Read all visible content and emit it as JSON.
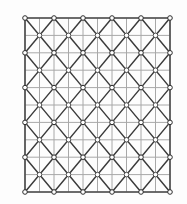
{
  "figure": {
    "type": "lattice-diagram",
    "background_color": "#fdfdfd",
    "width": 187,
    "height": 204
  },
  "lattice": {
    "description": "5 by 5 array of square cells; each cell carries both diagonals, a centre node, and nodes at every cell corner and edge midpoint",
    "cells_x": 5,
    "cells_y": 5,
    "origin_x": 25,
    "origin_y": 18,
    "cell_width": 29,
    "cell_height": 34.8,
    "corner_nodes_x": 6,
    "corner_nodes_y": 6,
    "centre_nodes": 25,
    "node_radius": 2.3,
    "colors": {
      "diagonal_edge": "#3b3b3b",
      "grid_edge": "#a8a8a8",
      "boundary_edge": "#4a4a4a",
      "node_fill": "#ffffff",
      "node_stroke": "#4f4f4f"
    },
    "stroke_widths": {
      "diagonal_edge": 1.45,
      "grid_edge": 1.0,
      "boundary_edge": 1.6
    }
  }
}
